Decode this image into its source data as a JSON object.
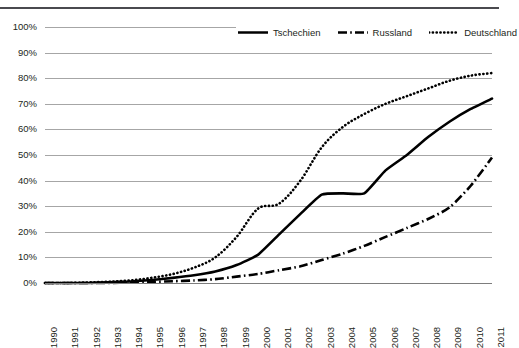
{
  "top_strip": {
    "ghost_text": "",
    "note": "cut-off text row at top edge"
  },
  "legend": {
    "position": "top-right-inside",
    "items": [
      {
        "label": "Tschechien",
        "style": "solid",
        "color": "#000000",
        "icon": "line-solid-icon"
      },
      {
        "label": "Russland",
        "style": "dash-dot",
        "color": "#000000",
        "icon": "line-dash-dot-icon"
      },
      {
        "label": "Deutschland",
        "style": "dotted",
        "color": "#000000",
        "icon": "line-dotted-icon"
      }
    ]
  },
  "axis": {
    "y_ticks": [
      "0%",
      "10%",
      "20%",
      "30%",
      "40%",
      "50%",
      "60%",
      "70%",
      "80%",
      "90%",
      "100%"
    ],
    "x_ticks": [
      "1990",
      "1991",
      "1992",
      "1993",
      "1994",
      "1995",
      "1996",
      "1997",
      "1998",
      "1999",
      "2000",
      "2001",
      "2002",
      "2003",
      "2004",
      "2005",
      "2006",
      "2007",
      "2008",
      "2009",
      "2010",
      "2011"
    ]
  },
  "chart_data": {
    "type": "line",
    "title": "",
    "subtitle": "",
    "xlabel": "",
    "ylabel": "",
    "ylim": [
      0,
      100
    ],
    "y_unit": "%",
    "grid": true,
    "legend_position": "top-right",
    "x": [
      1990,
      1991,
      1992,
      1993,
      1994,
      1995,
      1996,
      1997,
      1998,
      1999,
      2000,
      2001,
      2002,
      2003,
      2004,
      2005,
      2006,
      2007,
      2008,
      2009,
      2010,
      2011
    ],
    "categories": [
      "1990",
      "1991",
      "1992",
      "1993",
      "1994",
      "1995",
      "1996",
      "1997",
      "1998",
      "1999",
      "2000",
      "2001",
      "2002",
      "2003",
      "2004",
      "2005",
      "2006",
      "2007",
      "2008",
      "2009",
      "2010",
      "2011"
    ],
    "series": [
      {
        "name": "Tschechien",
        "style": "solid",
        "color": "#000000",
        "values": [
          0,
          0,
          0,
          0.3,
          0.6,
          1.2,
          2,
          3,
          4.5,
          7,
          11,
          19,
          27,
          34.5,
          35,
          35,
          44,
          50,
          57,
          63,
          68,
          72
        ]
      },
      {
        "name": "Russland",
        "style": "dash-dot",
        "color": "#000000",
        "values": [
          0,
          0,
          0,
          0,
          0.2,
          0.4,
          0.7,
          1,
          1.5,
          2.5,
          3.5,
          5,
          6.5,
          9,
          11.5,
          14.5,
          18,
          21.5,
          25,
          29.5,
          38,
          49
        ]
      },
      {
        "name": "Deutschland",
        "style": "dotted",
        "color": "#000000",
        "values": [
          0,
          0,
          0.2,
          0.5,
          1,
          2,
          3.5,
          6,
          10,
          18,
          29,
          31,
          40,
          53,
          61,
          66,
          70,
          73,
          76,
          79,
          81,
          82
        ]
      }
    ]
  }
}
